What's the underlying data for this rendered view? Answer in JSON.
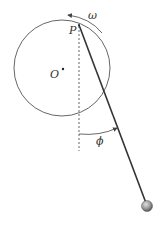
{
  "diagram": {
    "labels": {
      "omega": "ω",
      "point_p": "P",
      "center_o": "O",
      "phi": "ϕ"
    },
    "colors": {
      "stroke": "#333333",
      "circle": "#555555",
      "bob": "#9a9a9a"
    },
    "elements": [
      "circle",
      "center-point",
      "rod",
      "bob",
      "vertical-dashed-line",
      "angle-arc",
      "rotation-arrow"
    ]
  }
}
